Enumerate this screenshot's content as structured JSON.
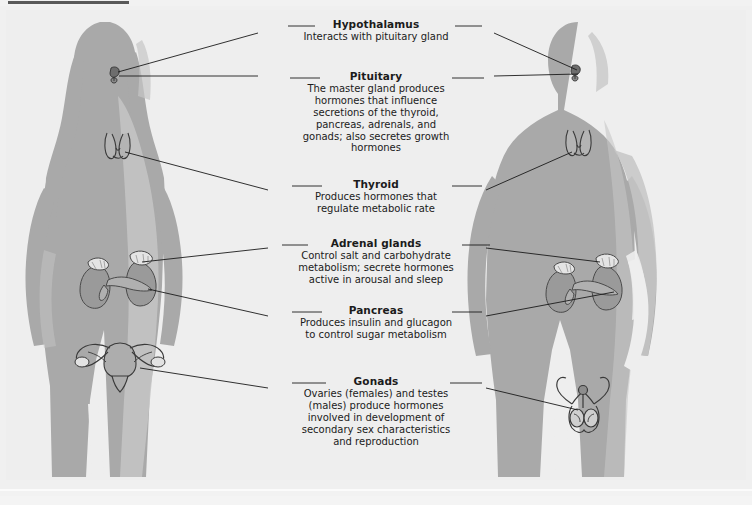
{
  "figure": {
    "background_color": "#eeeeee",
    "silhouette_color": "#a9a9a9",
    "silhouette_highlight_color": "#c6c6c6",
    "organ_color": "#9c9c9c",
    "line_color": "#1b1b1b",
    "text_color": "#1b1b1b"
  },
  "figures": [
    {
      "name": "female-figure",
      "side": "left"
    },
    {
      "name": "male-figure",
      "side": "right"
    }
  ],
  "labels": [
    {
      "id": "hypothalamus",
      "title": "Hypothalamus",
      "body": "Interacts with pituitary gland"
    },
    {
      "id": "pituitary",
      "title": "Pituitary",
      "body": "The master gland produces\nhormones that influence\nsecretions of the thyroid,\npancreas, adrenals, and\ngonads; also secretes growth\nhormones"
    },
    {
      "id": "thyroid",
      "title": "Thyroid",
      "body": "Produces hormones that\nregulate metabolic rate"
    },
    {
      "id": "adrenal",
      "title": "Adrenal glands",
      "body": "Control salt and carbohydrate\nmetabolism; secrete hormones\nactive in arousal and sleep"
    },
    {
      "id": "pancreas",
      "title": "Pancreas",
      "body": "Produces insulin and glucagon\nto control sugar metabolism"
    },
    {
      "id": "gonads",
      "title": "Gonads",
      "body": "Ovaries (females) and testes\n(males) produce hormones\ninvolved in development of\nsecondary sex characteristics\nand reproduction"
    }
  ],
  "organs": [
    {
      "name": "pituitary-gland-female",
      "x": 117,
      "y": 73
    },
    {
      "name": "pituitary-gland-male",
      "x": 578,
      "y": 71
    },
    {
      "name": "thyroid-gland-female",
      "x": 118,
      "y": 145
    },
    {
      "name": "thyroid-gland-male",
      "x": 578,
      "y": 142
    },
    {
      "name": "adrenal-kidneys-female",
      "x": 120,
      "y": 277
    },
    {
      "name": "adrenal-kidneys-male",
      "x": 585,
      "y": 280
    },
    {
      "name": "pancreas-female",
      "x": 120,
      "y": 283
    },
    {
      "name": "pancreas-male",
      "x": 585,
      "y": 287
    },
    {
      "name": "ovaries-uterus-female",
      "x": 110,
      "y": 355
    },
    {
      "name": "testes-male",
      "x": 585,
      "y": 398
    }
  ]
}
